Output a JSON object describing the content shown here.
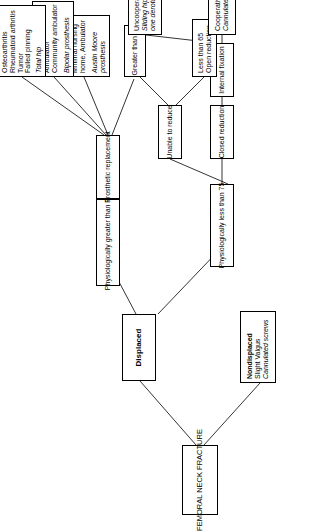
{
  "diagram": {
    "orientation": "rotated-90-ccw",
    "nodes": {
      "root": {
        "lines": [
          "FEMORAL NECK FRACTURE"
        ]
      },
      "nondisplaced": {
        "lines": [
          "Nondisplaced",
          "Slight Valgus",
          "Cannulated screws"
        ]
      },
      "displaced": {
        "lines": [
          "Displaced"
        ]
      },
      "physio_gt75": {
        "lines": [
          "Physiologically greater than 75"
        ]
      },
      "physio_lt75": {
        "lines": [
          "Physiologically less than 75"
        ]
      },
      "prosthetic": {
        "lines": [
          "Prosthetic replacement"
        ]
      },
      "closed_reduction": {
        "lines": [
          "Closed reduction"
        ]
      },
      "internal_fixation": {
        "lines": [
          "Internal fixation"
        ]
      },
      "unable_to_reduce": {
        "lines": [
          "Unable to reduce"
        ]
      },
      "greater_65": {
        "lines": [
          "Greater than 65"
        ]
      },
      "less_65": {
        "lines": [
          "Less than 65",
          "Open reduction"
        ]
      },
      "cooperative": {
        "lines": [
          "Cooperative patient",
          "Cannulated screws"
        ]
      },
      "uncooperative": {
        "lines": [
          "Uncooperative patient",
          "Sliding hip screw with",
          "one derotation screw"
        ]
      },
      "minimal_nursing": {
        "lines": [
          "Minimal nursing",
          "home, Ambulator",
          "",
          "Austin Moore",
          "prosthesis"
        ]
      },
      "nursing_home": {
        "lines": [
          "Nursing home,",
          "Ambulator",
          "Community ambulator",
          "",
          "Bipolar prosthesis"
        ]
      },
      "total_hip": {
        "lines": [
          "Osteoarthritis",
          "Rheumatoid arthritis",
          "Tumor",
          "Failed pinning",
          "",
          "Total hip"
        ]
      }
    }
  }
}
